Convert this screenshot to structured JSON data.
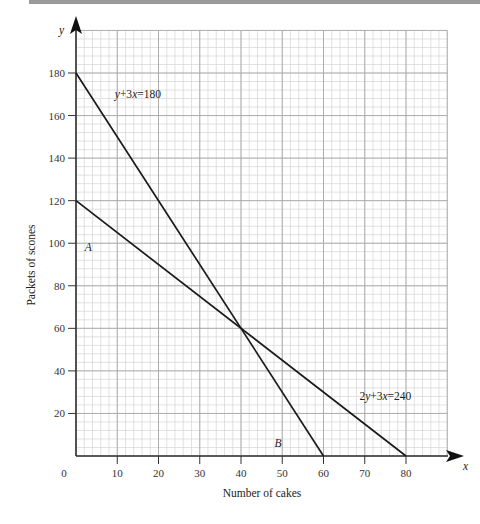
{
  "chart_data": {
    "type": "line",
    "title": "",
    "xlabel": "Number of cakes",
    "ylabel": "Packets of scones",
    "x_axis_symbol": "x",
    "y_axis_symbol": "y",
    "xlim": [
      0,
      90
    ],
    "ylim": [
      0,
      200
    ],
    "x_ticks": [
      10,
      20,
      30,
      40,
      50,
      60,
      70,
      80
    ],
    "y_ticks": [
      20,
      40,
      60,
      80,
      100,
      120,
      140,
      160,
      180
    ],
    "origin_label": "0",
    "grid": true,
    "minor_grid": {
      "x_step": 2,
      "y_step": 4
    },
    "major_grid": {
      "x_step": 10,
      "y_step": 20
    },
    "series": [
      {
        "name": "y+3x=180",
        "points": [
          [
            0,
            180
          ],
          [
            60,
            0
          ]
        ]
      },
      {
        "name": "2y+3x=240",
        "points": [
          [
            0,
            120
          ],
          [
            80,
            0
          ]
        ]
      }
    ],
    "annotations": [
      {
        "text": "y+3x=180",
        "x": 15,
        "y": 170
      },
      {
        "text": "2y+3x=240",
        "x": 75,
        "y": 28
      },
      {
        "text": "A",
        "x": 3,
        "y": 98,
        "italic": true
      },
      {
        "text": "B",
        "x": 49,
        "y": 6,
        "italic": true
      }
    ],
    "intersection": [
      40,
      60
    ],
    "legend": null
  },
  "colors": {
    "line": "#1a1a1a",
    "axis": "#333333",
    "minor_grid": "#d6d6d6",
    "major_grid": "#a8a8a8",
    "top_bar": "#9a9a9a"
  }
}
